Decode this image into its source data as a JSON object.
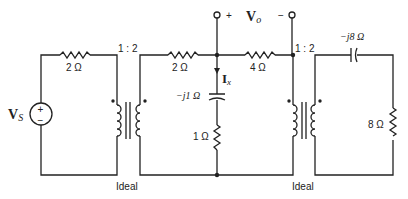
{
  "diagram": {
    "type": "circuit",
    "source": {
      "label_main": "V",
      "label_sub": "S",
      "plus": "+",
      "minus": "−"
    },
    "output": {
      "label_main": "V",
      "label_sub": "o",
      "plus": "+",
      "minus": "−"
    },
    "current": {
      "label_main": "I",
      "label_sub": "x"
    },
    "components": {
      "r_left": "2 Ω",
      "r_mid_left": "2 Ω",
      "r_mid_right": "4 Ω",
      "cap_shunt": "−j1 Ω",
      "r_shunt": "1 Ω",
      "cap_right": "−j8 Ω",
      "r_load": "8 Ω"
    },
    "transformers": [
      {
        "ratio": "1 : 2",
        "note": "Ideal"
      },
      {
        "ratio": "1 : 2",
        "note": "Ideal"
      }
    ],
    "colors": {
      "wire": "#222222",
      "background": "#ffffff"
    }
  }
}
